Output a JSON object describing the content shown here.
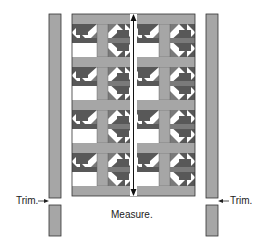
{
  "diagram": {
    "labels": {
      "measure": "Measure.",
      "trim_left": "Trim.",
      "trim_right": "Trim."
    },
    "colors": {
      "background": "#ffffff",
      "sashing": "#a6a6a6",
      "dark_fabric": "#585858",
      "medium_fabric": "#7a7a7a",
      "light_fabric": "#ffffff",
      "outline": "#333333",
      "border_strip": "#a6a6a6"
    },
    "quilt": {
      "block_rows": 4,
      "block_cols": 2,
      "block_style": "bear's paw variation with sashing"
    },
    "border_strips": [
      {
        "side": "left",
        "pieces": 2
      },
      {
        "side": "right",
        "pieces": 2
      }
    ]
  }
}
